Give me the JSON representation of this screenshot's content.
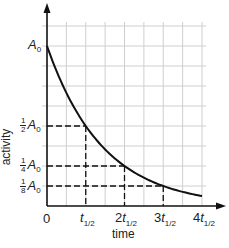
{
  "chart_data": {
    "type": "line",
    "title": "",
    "xlabel": "time",
    "ylabel": "activity",
    "x_ticks": [
      "0",
      "t1/2",
      "2t1/2",
      "3t1/2",
      "4t1/2"
    ],
    "y_ticks": [
      "A0",
      "1/2 A0",
      "1/4 A0",
      "1/8 A0"
    ],
    "series": [
      {
        "name": "radioactive decay",
        "x": [
          0,
          1,
          2,
          3,
          4
        ],
        "values": [
          1.0,
          0.5,
          0.25,
          0.125,
          0.0625
        ],
        "x_unit": "half-lives",
        "y_unit": "fraction of A0"
      }
    ],
    "annotations": [
      {
        "type": "dashed-guide",
        "x": 1,
        "y": 0.5
      },
      {
        "type": "dashed-guide",
        "x": 2,
        "y": 0.25
      },
      {
        "type": "dashed-guide",
        "x": 3,
        "y": 0.125
      }
    ],
    "grid": true,
    "legend": "none",
    "xlim": [
      0,
      4
    ],
    "ylim": [
      0,
      1.25
    ]
  },
  "labels": {
    "y_axis_title": "activity",
    "x_axis_title": "time",
    "origin": "0",
    "a_symbol": "A",
    "a_sub": "0",
    "t_symbol": "t",
    "t_sub": "1/2",
    "half_num": "1",
    "half_den": "2",
    "quarter_num": "1",
    "quarter_den": "4",
    "eighth_num": "1",
    "eighth_den": "8",
    "mult2": "2",
    "mult3": "3",
    "mult4": "4"
  },
  "colors": {
    "axis": "#111111",
    "grid": "#cfcfcf",
    "curve": "#111111",
    "dash": "#111111"
  }
}
